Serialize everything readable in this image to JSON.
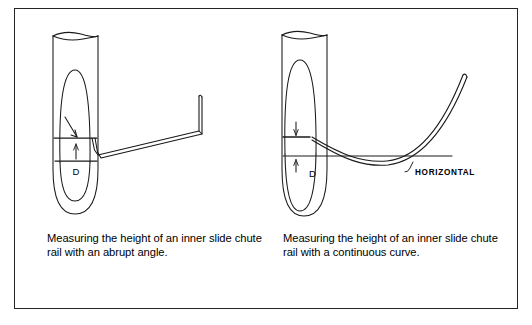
{
  "figure": {
    "background_color": "#ffffff",
    "border_color": "#242424",
    "ink_color": "#1a1a1a"
  },
  "panels": [
    {
      "id": "abrupt-angle",
      "caption": "Measuring the height of an inner slide chute rail with an abrupt angle.",
      "diagram": {
        "type": "technical-line-drawing",
        "subject": "inner slide chute rail measured against a vertical tube",
        "rail_style": "abrupt angle",
        "labels": {
          "dimension": "D"
        },
        "elements": [
          "vertical-tube",
          "tube-opening-ellipse",
          "inner-ellipse",
          "upper-reference-line",
          "lower-reference-line",
          "dimension-arrow",
          "angle-pointer",
          "rail-abrupt-angle"
        ]
      }
    },
    {
      "id": "continuous-curve",
      "caption": "Measuring the height of an inner slide chute rail with a continuous curve.",
      "diagram": {
        "type": "technical-line-drawing",
        "subject": "inner slide chute rail measured against a vertical tube",
        "rail_style": "continuous curve",
        "labels": {
          "dimension": "D",
          "horizontal": "HORIZONTAL"
        },
        "elements": [
          "vertical-tube",
          "tube-opening-ellipse",
          "inner-ellipse",
          "upper-reference-line",
          "horizontal-reference-line",
          "dimension-arrow-upper",
          "dimension-arrow-lower",
          "rail-continuous-curve",
          "horizontal-leader-line"
        ]
      }
    }
  ]
}
